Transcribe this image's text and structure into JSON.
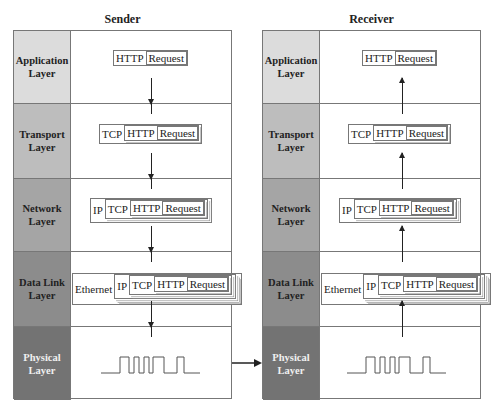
{
  "sender": {
    "title": "Sender",
    "direction": "down",
    "layers": [
      {
        "label_line1": "Application",
        "label_line2": "Layer",
        "color": "#dcdcdc",
        "text_color": "#222222",
        "headers": [
          "HTTP"
        ],
        "payload": "Request"
      },
      {
        "label_line1": "Transport",
        "label_line2": "Layer",
        "color": "#bdbdbd",
        "text_color": "#222222",
        "headers": [
          "TCP",
          "HTTP"
        ],
        "payload": "Request"
      },
      {
        "label_line1": "Network",
        "label_line2": "Layer",
        "color": "#a5a5a5",
        "text_color": "#222222",
        "headers": [
          "IP",
          "TCP",
          "HTTP"
        ],
        "payload": "Request"
      },
      {
        "label_line1": "Data Link",
        "label_line2": "Layer",
        "color": "#8c8c8c",
        "text_color": "#222222",
        "headers": [
          "Ethernet",
          "IP",
          "TCP",
          "HTTP"
        ],
        "payload": "Request"
      },
      {
        "label_line1": "Physical",
        "label_line2": "Layer",
        "color": "#737373",
        "text_color": "#f0f0f0",
        "signal": "square-wave-icon"
      }
    ]
  },
  "receiver": {
    "title": "Receiver",
    "direction": "up",
    "layers": [
      {
        "label_line1": "Application",
        "label_line2": "Layer",
        "color": "#dcdcdc",
        "text_color": "#222222",
        "headers": [
          "HTTP"
        ],
        "payload": "Request"
      },
      {
        "label_line1": "Transport",
        "label_line2": "Layer",
        "color": "#bdbdbd",
        "text_color": "#222222",
        "headers": [
          "TCP",
          "HTTP"
        ],
        "payload": "Request"
      },
      {
        "label_line1": "Network",
        "label_line2": "Layer",
        "color": "#a5a5a5",
        "text_color": "#222222",
        "headers": [
          "IP",
          "TCP",
          "HTTP"
        ],
        "payload": "Request"
      },
      {
        "label_line1": "Data Link",
        "label_line2": "Layer",
        "color": "#8c8c8c",
        "text_color": "#222222",
        "headers": [
          "Ethernet",
          "IP",
          "TCP",
          "HTTP"
        ],
        "payload": "Request"
      },
      {
        "label_line1": "Physical",
        "label_line2": "Layer",
        "color": "#737373",
        "text_color": "#f0f0f0",
        "signal": "square-wave-icon"
      }
    ]
  },
  "link_arrow": "right-arrow-icon"
}
